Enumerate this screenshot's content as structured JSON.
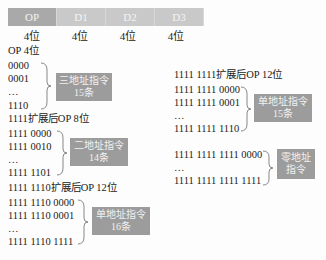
{
  "header": {
    "fields": [
      "OP",
      "D1",
      "D2",
      "D3"
    ],
    "bits": [
      "4位",
      "4位",
      "4位",
      "4位"
    ]
  },
  "groups": [
    {
      "title": "OP 4位",
      "codes": [
        "0000",
        "0001",
        "…",
        "1110"
      ],
      "label_line1": "三地址指令",
      "label_line2": "15条"
    },
    {
      "title": "1111扩展后OP 8位",
      "codes": [
        "1111 0000",
        "1111 0010",
        "…",
        "1111 1101"
      ],
      "label_line1": "二地址指令",
      "label_line2": "14条"
    },
    {
      "title": "1111 1110扩展后OP 12位",
      "codes": [
        "1111 1110 0000",
        "1111 1110 0001",
        "…",
        "1111 1110 1111"
      ],
      "label_line1": "单地址指令",
      "label_line2": "16条"
    },
    {
      "title": "1111 1111扩展后OP 12位",
      "codes": [
        "1111 1111 0000",
        "1111 1111 0001",
        "…",
        "1111 1111 1110"
      ],
      "label_line1": "单地址指令",
      "label_line2": "15条"
    },
    {
      "title": "",
      "codes": [
        "1111 1111 1111 0000",
        "…",
        "1111 1111 1111 1111"
      ],
      "label_line1": "零地址",
      "label_line2": "指令"
    }
  ]
}
